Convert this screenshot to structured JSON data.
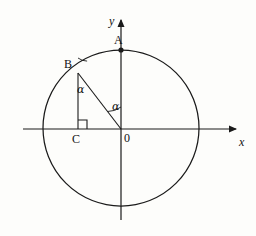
{
  "figure": {
    "background_color": "#fdfdfb",
    "stroke_color": "#1a1a1a",
    "label_color": "#111111"
  },
  "axes": {
    "x_label": "x",
    "y_label": "y",
    "origin_label": "0",
    "x_axis": {
      "x1": 23,
      "y1": 129,
      "x2": 238,
      "y2": 129,
      "arrow": "right"
    },
    "y_axis": {
      "x1": 121,
      "y1": 220,
      "x2": 121,
      "y2": 18,
      "arrow": "up"
    },
    "x_label_pos": {
      "x": 239,
      "y": 136
    },
    "y_label_pos": {
      "x": 109,
      "y": 16
    },
    "origin_label_pos": {
      "x": 124,
      "y": 132
    }
  },
  "circle": {
    "center_x": 121,
    "center_y": 128,
    "radius": 78
  },
  "points": [
    {
      "name": "A",
      "label": "A",
      "x": 121,
      "y": 50,
      "label_x": 114,
      "label_y": 34,
      "marker": true
    },
    {
      "name": "B",
      "label": "B",
      "x": 78,
      "y": 73,
      "label_x": 64,
      "label_y": 58,
      "marker": false
    },
    {
      "name": "C",
      "label": "C",
      "x": 78,
      "y": 129,
      "label_x": 72,
      "label_y": 133,
      "marker": false
    }
  ],
  "segments": [
    {
      "name": "segment-BC",
      "x1": 78,
      "y1": 73,
      "x2": 78,
      "y2": 129
    },
    {
      "name": "segment-BO",
      "x1": 78,
      "y1": 73,
      "x2": 121,
      "y2": 129
    }
  ],
  "right_angle": {
    "name": "right-angle-at-C",
    "vertex_x": 78,
    "vertex_y": 129,
    "size": 9
  },
  "angles": [
    {
      "name": "angle-alpha-at-B",
      "label": "α",
      "label_x": 77,
      "label_y": 84,
      "vertex_x": 78,
      "vertex_y": 73,
      "arc_radius": 15,
      "start_deg": 90,
      "end_deg": 52.5
    },
    {
      "name": "angle-alpha-at-O",
      "label": "α",
      "label_x": 112,
      "label_y": 102,
      "vertex_x": 121,
      "vertex_y": 129,
      "arc_radius": 22,
      "start_deg": 90,
      "end_deg": 127.5
    }
  ]
}
